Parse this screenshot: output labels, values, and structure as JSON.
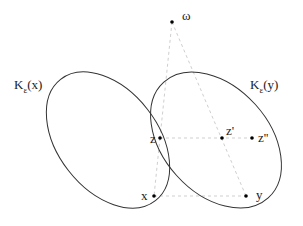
{
  "diagram": {
    "type": "set-diagram",
    "sets": [
      {
        "id": "Kx",
        "label_main": "K",
        "label_sub": "ε",
        "label_arg": "(x)"
      },
      {
        "id": "Ky",
        "label_main": "K",
        "label_sub": "ε",
        "label_arg": "(y)"
      }
    ],
    "points": [
      {
        "id": "omega",
        "label": "ω"
      },
      {
        "id": "z",
        "label": "z"
      },
      {
        "id": "z1",
        "label": "z'"
      },
      {
        "id": "z2",
        "label": "z''"
      },
      {
        "id": "x",
        "label": "x"
      },
      {
        "id": "y",
        "label": "y"
      }
    ],
    "edges": [
      {
        "from": "omega",
        "to": "z",
        "style": "dashed"
      },
      {
        "from": "z",
        "to": "x",
        "style": "dashed"
      },
      {
        "from": "omega",
        "to": "y",
        "style": "dashed"
      },
      {
        "from": "z",
        "to": "z2",
        "style": "dashed"
      },
      {
        "from": "x",
        "to": "y",
        "style": "dashed"
      }
    ],
    "colors": {
      "stroke": "#333333",
      "dashed": "#c8c8c8",
      "dot": "#000000"
    }
  }
}
